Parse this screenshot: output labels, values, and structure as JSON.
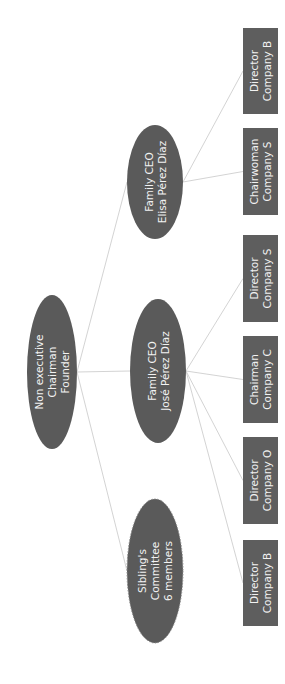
{
  "diagram": {
    "type": "org-chart",
    "orientation": "rotated-90-ccw",
    "colors": {
      "node_fill": "#5a5a5a",
      "box_fill": "#5e5e5e",
      "text": "#f2f2f2",
      "edge": "#c8c8c8",
      "background": "#ffffff"
    },
    "nodes": {
      "founder": {
        "lines": [
          "Non executive",
          "Chairman",
          "Founder"
        ],
        "shape": "ellipse"
      },
      "elisa": {
        "lines": [
          "Family CEO",
          "Elisa Pérez Díaz"
        ],
        "shape": "ellipse"
      },
      "jose": {
        "lines": [
          "Family CEO",
          "José Pérez Díaz"
        ],
        "shape": "ellipse"
      },
      "siblings": {
        "lines": [
          "Sibling's",
          "Committee",
          "6 members"
        ],
        "shape": "ellipse",
        "border": "dashed"
      },
      "box1": {
        "lines": [
          "Director",
          "Company B"
        ],
        "shape": "rect"
      },
      "box2": {
        "lines": [
          "Chairwoman",
          "Company S"
        ],
        "shape": "rect"
      },
      "box3": {
        "lines": [
          "Director",
          "Company S"
        ],
        "shape": "rect"
      },
      "box4": {
        "lines": [
          "Chairman",
          "Company C"
        ],
        "shape": "rect"
      },
      "box5": {
        "lines": [
          "Director",
          "Company O"
        ],
        "shape": "rect"
      },
      "box6": {
        "lines": [
          "Director",
          "Company B"
        ],
        "shape": "rect"
      }
    },
    "edges": [
      [
        "founder",
        "elisa"
      ],
      [
        "founder",
        "jose"
      ],
      [
        "founder",
        "siblings"
      ],
      [
        "elisa",
        "box1"
      ],
      [
        "elisa",
        "box2"
      ],
      [
        "jose",
        "box3"
      ],
      [
        "jose",
        "box4"
      ],
      [
        "jose",
        "box5"
      ],
      [
        "jose",
        "box6"
      ]
    ]
  }
}
